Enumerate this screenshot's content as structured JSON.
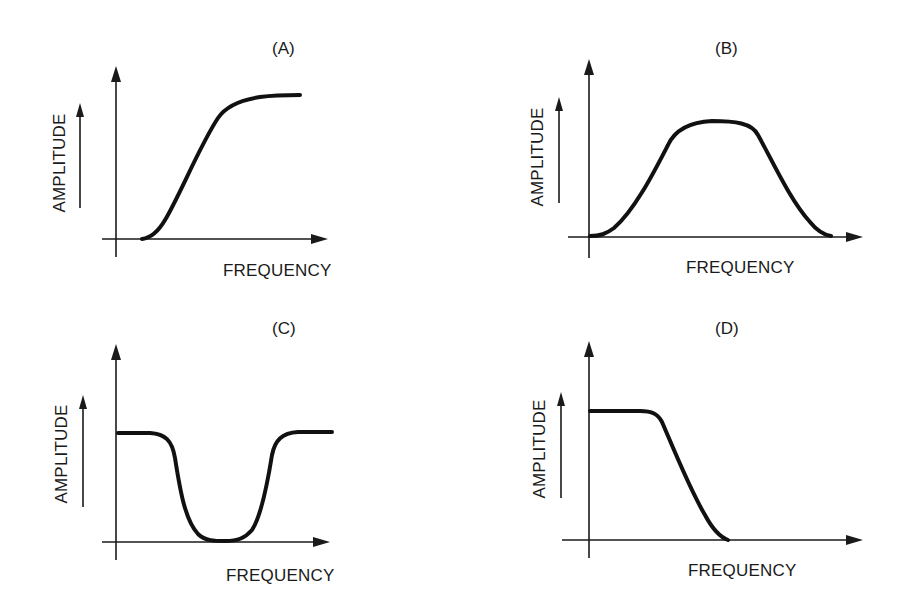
{
  "figure": {
    "panels": [
      {
        "id": "A",
        "label": "(A)",
        "x_axis_label": "FREQUENCY",
        "y_axis_label": "AMPLITUDE",
        "response_type": "high-pass",
        "label_pos": [
          272,
          54
        ],
        "ylabel_pos": [
          65,
          163
        ],
        "xlabel_pos": [
          223,
          276
        ],
        "yaxis": {
          "x": 116,
          "y_top": 66,
          "y_bottom": 257
        },
        "xaxis": {
          "y": 239,
          "x_left": 102,
          "x_right": 328
        },
        "side_arrow": {
          "x": 80,
          "y_top": 103,
          "y_bottom": 208
        },
        "curve_path": "M142,239 C150,238 158,232 165,220 C180,195 200,145 218,118 C226,106 240,100 260,97 C275,95 290,95 300,95"
      },
      {
        "id": "B",
        "label": "(B)",
        "x_axis_label": "FREQUENCY",
        "y_axis_label": "AMPLITUDE",
        "response_type": "band-pass",
        "label_pos": [
          715,
          54
        ],
        "ylabel_pos": [
          543,
          157
        ],
        "xlabel_pos": [
          686,
          273
        ],
        "yaxis": {
          "x": 589,
          "y_top": 59,
          "y_bottom": 258
        },
        "xaxis": {
          "y": 237,
          "x_left": 568,
          "x_right": 863
        },
        "side_arrow": {
          "x": 559,
          "y_top": 97,
          "y_bottom": 203
        },
        "curve_path": "M590,236 C600,236 606,234 614,228 C635,210 655,170 668,145 C675,130 690,122 712,121 C735,121 752,123 758,135 C772,160 790,200 810,222 C818,232 825,235 831,236"
      },
      {
        "id": "C",
        "label": "(C)",
        "x_axis_label": "FREQUENCY",
        "y_axis_label": "AMPLITUDE",
        "response_type": "band-stop",
        "label_pos": [
          272,
          334
        ],
        "ylabel_pos": [
          67,
          454
        ],
        "xlabel_pos": [
          226,
          581
        ],
        "yaxis": {
          "x": 116,
          "y_top": 344,
          "y_bottom": 560
        },
        "xaxis": {
          "y": 542,
          "x_left": 102,
          "x_right": 330
        },
        "side_arrow": {
          "x": 83,
          "y_top": 395,
          "y_bottom": 507
        },
        "curve_path": "M118,433 L150,433 C165,434 172,440 175,458 C180,490 185,520 198,534 C205,541 215,541 225,541 C238,541 245,538 252,530 C262,515 268,480 272,455 C275,440 282,433 298,432 L332,432"
      },
      {
        "id": "D",
        "label": "(D)",
        "x_axis_label": "FREQUENCY",
        "y_axis_label": "AMPLITUDE",
        "response_type": "low-pass",
        "label_pos": [
          715,
          334
        ],
        "ylabel_pos": [
          545,
          449
        ],
        "xlabel_pos": [
          688,
          576
        ],
        "yaxis": {
          "x": 589,
          "y_top": 341,
          "y_bottom": 558
        },
        "xaxis": {
          "y": 540,
          "x_left": 562,
          "x_right": 863
        },
        "side_arrow": {
          "x": 561,
          "y_top": 392,
          "y_bottom": 498
        },
        "curve_path": "M590,411 L640,411 C652,411 658,414 662,422 C672,445 690,490 705,515 C713,530 720,537 728,540"
      }
    ]
  },
  "colors": {
    "ink": "#1a1a1a",
    "background": "#ffffff"
  }
}
